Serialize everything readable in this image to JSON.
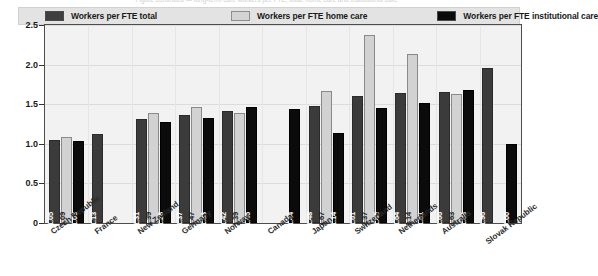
{
  "top_caption": "Figure continued — long-term care workers per FTE, total, home care and institutional care",
  "legend": {
    "items": [
      {
        "label": "Workers per FTE total",
        "color": "#3b3b3b",
        "key": "total"
      },
      {
        "label": "Workers per FTE home care",
        "color": "#d2d2d2",
        "key": "home"
      },
      {
        "label": "Workers per FTE institutional care",
        "color": "#0b0b0b",
        "key": "inst"
      }
    ]
  },
  "chart_data": {
    "type": "bar",
    "title": "",
    "xlabel": "",
    "ylabel": "",
    "ylim": [
      0,
      2.5
    ],
    "yticks": [
      "0",
      "0.5",
      "1.0",
      "1.5",
      "2.0",
      "2.5"
    ],
    "ytick_values": [
      0,
      0.5,
      1.0,
      1.5,
      2.0,
      2.5
    ],
    "grid": true,
    "legend_position": "top",
    "categories": [
      "Czech Republic",
      "France",
      "New Zealand",
      "Germany",
      "Norway",
      "Canada",
      "Japan",
      "Switzerland",
      "Netherlands",
      "Australia",
      "Slovak Republic"
    ],
    "series": [
      {
        "name": "Workers per FTE total",
        "color": "#3b3b3b",
        "values": [
          1.05,
          1.13,
          1.31,
          1.37,
          1.42,
          null,
          1.48,
          1.61,
          1.64,
          1.66,
          1.96
        ],
        "labels": [
          "1.05",
          "1.13",
          "1.31",
          "1.37",
          "1.42",
          "",
          "1.48",
          "1.61",
          "1.64",
          "1.66",
          "1.96"
        ]
      },
      {
        "name": "Workers per FTE home care",
        "color": "#d2d2d2",
        "values": [
          1.09,
          null,
          1.39,
          1.47,
          1.39,
          null,
          1.67,
          2.37,
          2.14,
          1.63,
          null
        ],
        "labels": [
          "1.09",
          "",
          "1.39",
          "1.47",
          "1.39",
          "",
          "1.67",
          "2.37",
          "2.14",
          "1.63",
          ""
        ]
      },
      {
        "name": "Workers per FTE institutional care",
        "color": "#0b0b0b",
        "values": [
          1.03,
          null,
          1.28,
          1.33,
          1.46,
          1.44,
          1.14,
          1.45,
          1.51,
          1.68,
          1.0
        ],
        "labels": [
          "1.03",
          "",
          "1.28",
          "1.33",
          "1.46",
          "1.44",
          "1.14",
          "1.45",
          "1.51",
          "1.68",
          "1.00"
        ]
      }
    ]
  }
}
